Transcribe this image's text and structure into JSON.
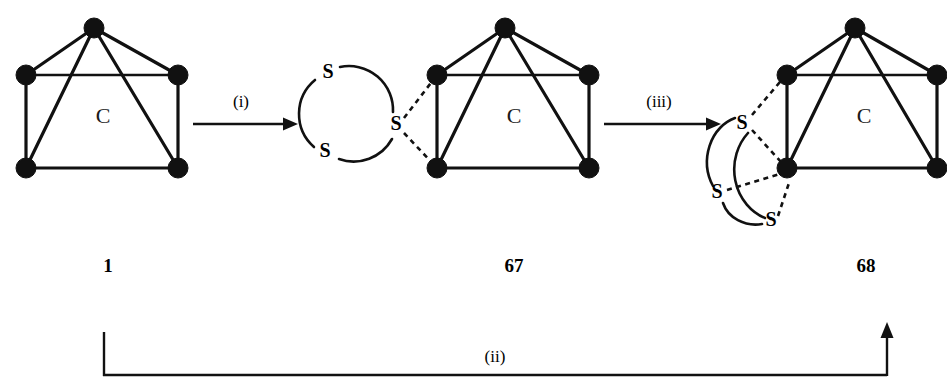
{
  "scheme": {
    "type": "reaction-scheme",
    "background_color": "#ffffff",
    "line_color": "#111111",
    "structures": [
      {
        "id": "structure-1",
        "compound_label": "1",
        "core_label": "C",
        "vertex_count": 5,
        "sulfur_atoms": [],
        "description": "square-pyramidal metal carbide cluster"
      },
      {
        "id": "structure-67",
        "compound_label": "67",
        "core_label": "C",
        "vertex_count": 5,
        "sulfur_atoms": [
          "S",
          "S",
          "S"
        ],
        "sulfur_ring": "S3 ring bridging two cluster vertices",
        "description": "cluster with trisulfide ring ligand"
      },
      {
        "id": "structure-68",
        "compound_label": "68",
        "core_label": "C",
        "vertex_count": 5,
        "sulfur_atoms": [
          "S",
          "S",
          "S"
        ],
        "sulfur_ring": "S3 unit capping cluster edge",
        "description": "cluster with face-capping trisulfur unit"
      }
    ],
    "arrows": [
      {
        "id": "arrow-i",
        "label": "(i)",
        "from": "1",
        "to": "67",
        "direction": "right"
      },
      {
        "id": "arrow-iii",
        "label": "(iii)",
        "from": "67",
        "to": "68",
        "direction": "right"
      },
      {
        "id": "arrow-ii",
        "label": "(ii)",
        "from": "1",
        "to": "68",
        "direction": "bracket-up-right"
      }
    ]
  }
}
